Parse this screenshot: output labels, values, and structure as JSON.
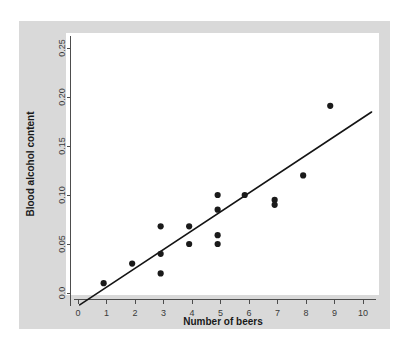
{
  "figure": {
    "panel_background": "#d9d9d9",
    "plot_background": "#ffffff",
    "outer_background": "#ffffff"
  },
  "chart_data": {
    "type": "scatter",
    "title": "",
    "subtitle": "",
    "xlabel": "Number of beers",
    "ylabel": "Blood alcohol content",
    "xlim": [
      0,
      10.3
    ],
    "ylim": [
      -0.0135,
      0.262
    ],
    "grid": false,
    "legend": null,
    "xticks": [
      0,
      1,
      2,
      3,
      4,
      5,
      6,
      7,
      8,
      9,
      10
    ],
    "xtick_labels": [
      "0",
      "1",
      "2",
      "3",
      "4",
      "5",
      "6",
      "7",
      "8",
      "9",
      "10"
    ],
    "yticks": [
      0.0,
      0.05,
      0.1,
      0.15,
      0.2,
      0.25
    ],
    "ytick_labels": [
      "0.0",
      "0.05",
      "0.10",
      "0.15",
      "0.20",
      "0.25"
    ],
    "marker": "filled-circle",
    "marker_color": "#1a1a1a",
    "marker_size": 3.1,
    "points": [
      {
        "x": 0.9,
        "y": 0.01
      },
      {
        "x": 1.9,
        "y": 0.03
      },
      {
        "x": 2.9,
        "y": 0.068
      },
      {
        "x": 2.9,
        "y": 0.04
      },
      {
        "x": 2.9,
        "y": 0.02
      },
      {
        "x": 3.9,
        "y": 0.068
      },
      {
        "x": 3.9,
        "y": 0.05
      },
      {
        "x": 4.9,
        "y": 0.1
      },
      {
        "x": 4.9,
        "y": 0.085
      },
      {
        "x": 4.9,
        "y": 0.059
      },
      {
        "x": 4.9,
        "y": 0.05
      },
      {
        "x": 5.85,
        "y": 0.1
      },
      {
        "x": 6.9,
        "y": 0.095
      },
      {
        "x": 6.9,
        "y": 0.09
      },
      {
        "x": 7.9,
        "y": 0.12
      },
      {
        "x": 8.85,
        "y": 0.191
      }
    ],
    "fit_line": {
      "type": "linear-regression",
      "color": "#141414",
      "slope": 0.01922,
      "intercept": -0.0133,
      "x_start": 0.06,
      "x_end": 10.3
    }
  }
}
